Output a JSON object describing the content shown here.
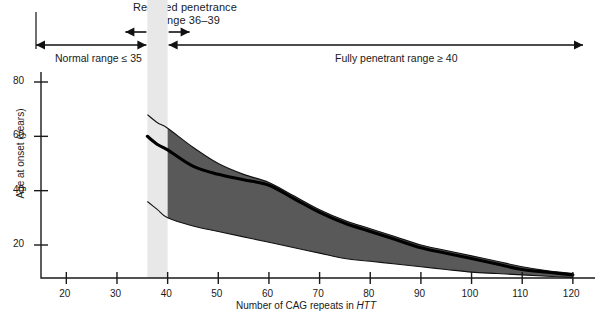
{
  "annotations": {
    "reduced_penetrance_title": "Reduced penetrance",
    "reduced_penetrance_subtitle": "range 36–39",
    "normal_range_label": "Normal range ≤ 35",
    "fully_penetrant_label": "Fully penetrant range ≥ 40"
  },
  "chart_data": {
    "type": "line",
    "title": "",
    "xlabel": "Number of CAG repeats in HTT",
    "xlabel_plain": "Number of CAG repeats in ",
    "xlabel_italic": "HTT",
    "ylabel": "Age at onset (years)",
    "xlim": [
      15,
      122
    ],
    "ylim": [
      0,
      88
    ],
    "grid": false,
    "legend": false,
    "xticks": [
      20,
      30,
      40,
      50,
      60,
      70,
      80,
      90,
      100,
      110,
      120
    ],
    "yticks": [
      20,
      40,
      60,
      80
    ],
    "x": [
      36,
      38,
      40,
      45,
      50,
      55,
      60,
      65,
      70,
      75,
      80,
      85,
      90,
      95,
      100,
      105,
      110,
      115,
      120
    ],
    "series": [
      {
        "name": "Median age at onset",
        "style": "bold-line",
        "values": [
          60,
          57,
          55,
          49,
          46,
          44,
          42,
          37,
          32,
          28,
          25,
          22,
          19,
          17,
          15,
          13,
          11,
          10,
          9
        ]
      },
      {
        "name": "Upper bound of range",
        "style": "thin-line",
        "values": [
          68,
          65,
          63,
          56,
          50,
          46,
          43,
          38,
          33,
          29,
          26,
          23,
          20,
          18,
          16,
          14,
          12,
          10.5,
          9.5
        ]
      },
      {
        "name": "Lower bound of range",
        "style": "thin-line",
        "values": [
          36,
          33,
          30,
          27,
          25,
          23,
          21,
          19,
          17,
          15,
          14,
          13,
          12,
          11,
          10,
          9.5,
          9,
          8.5,
          8
        ]
      }
    ],
    "band": {
      "name": "Range of age at onset",
      "fill_color": "#595959",
      "x_start": 40,
      "x_end": 120
    },
    "highlight_band": {
      "name": "Reduced penetrance zone",
      "x_start": 36,
      "x_end": 40,
      "color": "#e8e8e8"
    },
    "axis_color": "#1a1a1a"
  }
}
